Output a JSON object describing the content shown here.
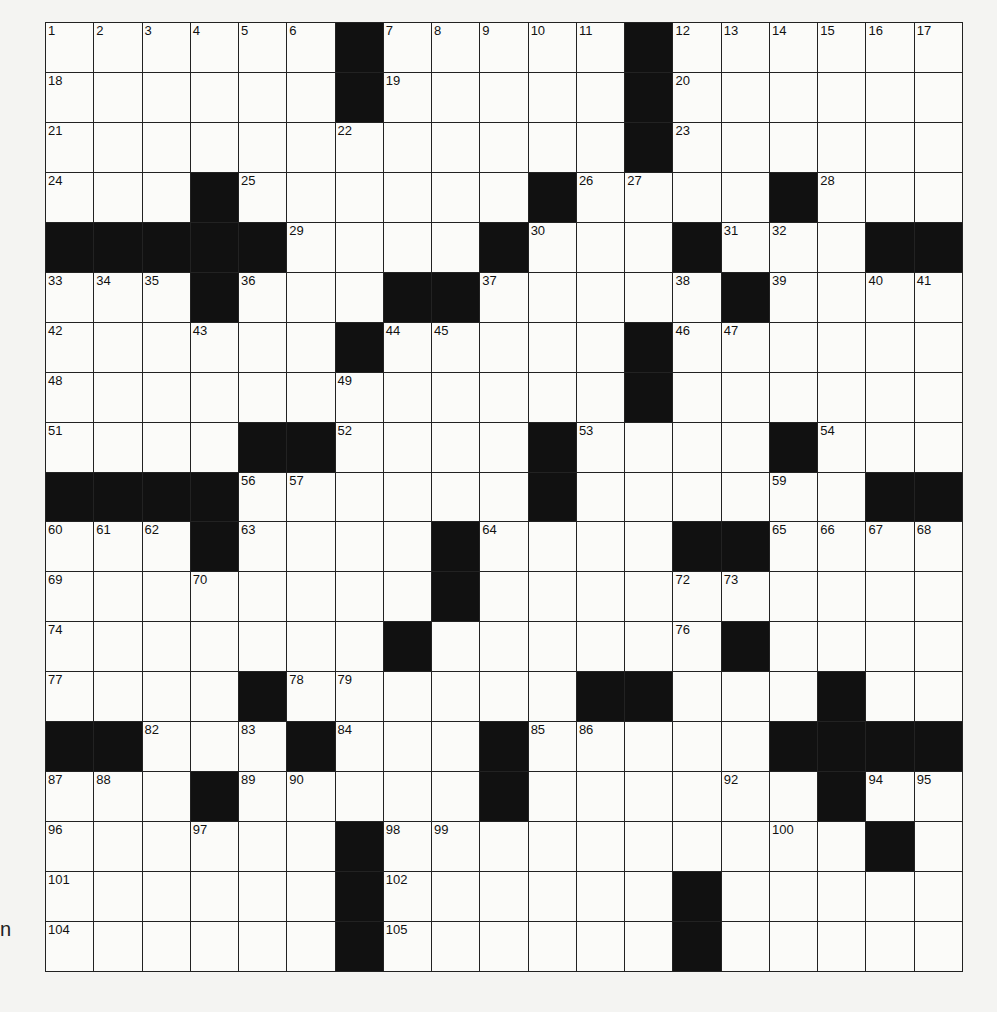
{
  "puzzle": {
    "cols": 19,
    "rows": 19,
    "layout": [
      "......#.....#......",
      "......#.....#......",
      "............#......",
      "...#......#....#...",
      "#####....#...#...##",
      "...#...##.....#....",
      "......#.....#......",
      "............#......",
      "....##....#....#...",
      "####......#......##",
      "...#....#....##....",
      "........#..........",
      ".......#......#....",
      "....#......##...#..",
      "##...#...#.....####",
      "...#.....#......#..",
      "......#..........#.",
      "......#......#.....",
      "......#......#....."
    ],
    "numbers": [
      [
        0,
        0,
        1
      ],
      [
        0,
        1,
        2
      ],
      [
        0,
        2,
        3
      ],
      [
        0,
        3,
        4
      ],
      [
        0,
        4,
        5
      ],
      [
        0,
        5,
        6
      ],
      [
        0,
        7,
        7
      ],
      [
        0,
        8,
        8
      ],
      [
        0,
        9,
        9
      ],
      [
        0,
        10,
        10
      ],
      [
        0,
        11,
        11
      ],
      [
        0,
        13,
        12
      ],
      [
        0,
        14,
        13
      ],
      [
        0,
        15,
        14
      ],
      [
        0,
        16,
        15
      ],
      [
        0,
        17,
        16
      ],
      [
        0,
        18,
        17
      ],
      [
        1,
        0,
        18
      ],
      [
        1,
        7,
        19
      ],
      [
        1,
        13,
        20
      ],
      [
        2,
        0,
        21
      ],
      [
        2,
        6,
        22
      ],
      [
        2,
        13,
        23
      ],
      [
        3,
        0,
        24
      ],
      [
        3,
        4,
        25
      ],
      [
        3,
        11,
        26
      ],
      [
        3,
        12,
        27
      ],
      [
        3,
        16,
        28
      ],
      [
        4,
        5,
        29
      ],
      [
        4,
        10,
        30
      ],
      [
        4,
        14,
        31
      ],
      [
        4,
        15,
        32
      ],
      [
        5,
        0,
        33
      ],
      [
        5,
        1,
        34
      ],
      [
        5,
        2,
        35
      ],
      [
        5,
        4,
        36
      ],
      [
        5,
        9,
        37
      ],
      [
        5,
        13,
        38
      ],
      [
        5,
        15,
        39
      ],
      [
        5,
        17,
        40
      ],
      [
        5,
        18,
        41
      ],
      [
        6,
        0,
        42
      ],
      [
        6,
        3,
        43
      ],
      [
        6,
        7,
        44
      ],
      [
        6,
        8,
        45
      ],
      [
        6,
        13,
        46
      ],
      [
        6,
        14,
        47
      ],
      [
        7,
        0,
        48
      ],
      [
        7,
        6,
        49
      ],
      [
        7,
        12,
        50
      ],
      [
        8,
        0,
        51
      ],
      [
        8,
        6,
        52
      ],
      [
        8,
        11,
        53
      ],
      [
        8,
        16,
        54
      ],
      [
        9,
        3,
        55
      ],
      [
        9,
        4,
        56
      ],
      [
        9,
        5,
        57
      ],
      [
        9,
        10,
        58
      ],
      [
        9,
        15,
        59
      ],
      [
        10,
        0,
        60
      ],
      [
        10,
        1,
        61
      ],
      [
        10,
        2,
        62
      ],
      [
        10,
        4,
        63
      ],
      [
        10,
        9,
        64
      ],
      [
        10,
        15,
        65
      ],
      [
        10,
        16,
        66
      ],
      [
        10,
        17,
        67
      ],
      [
        10,
        18,
        68
      ],
      [
        11,
        0,
        69
      ],
      [
        11,
        3,
        70
      ],
      [
        11,
        8,
        71
      ],
      [
        11,
        13,
        72
      ],
      [
        11,
        14,
        73
      ],
      [
        12,
        0,
        74
      ],
      [
        12,
        7,
        75
      ],
      [
        12,
        13,
        76
      ],
      [
        13,
        0,
        77
      ],
      [
        13,
        5,
        78
      ],
      [
        13,
        6,
        79
      ],
      [
        13,
        12,
        80
      ],
      [
        13,
        16,
        81
      ],
      [
        14,
        2,
        82
      ],
      [
        14,
        4,
        83
      ],
      [
        14,
        6,
        84
      ],
      [
        14,
        10,
        85
      ],
      [
        14,
        11,
        86
      ],
      [
        15,
        0,
        87
      ],
      [
        15,
        1,
        88
      ],
      [
        15,
        4,
        89
      ],
      [
        15,
        5,
        90
      ],
      [
        15,
        9,
        91
      ],
      [
        15,
        14,
        92
      ],
      [
        15,
        16,
        93
      ],
      [
        15,
        17,
        94
      ],
      [
        15,
        18,
        95
      ],
      [
        16,
        0,
        96
      ],
      [
        16,
        3,
        97
      ],
      [
        16,
        7,
        98
      ],
      [
        16,
        8,
        99
      ],
      [
        16,
        15,
        100
      ],
      [
        17,
        0,
        101
      ],
      [
        17,
        7,
        102
      ],
      [
        17,
        13,
        103
      ],
      [
        18,
        0,
        104
      ],
      [
        18,
        7,
        105
      ],
      [
        18,
        13,
        106
      ]
    ]
  },
  "edge_text": "n"
}
